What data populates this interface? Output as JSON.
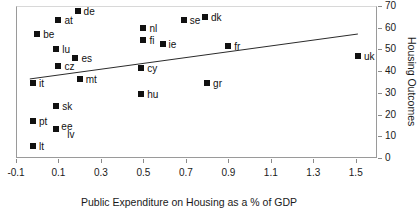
{
  "chart_data": {
    "type": "scatter",
    "title": "",
    "xlabel": "Public Expenditure on Housing as a % of GDP",
    "ylabel": "Housing Outcomes",
    "xlim": [
      -0.1,
      1.6
    ],
    "ylim": [
      0,
      70
    ],
    "xticks": [
      "-0.1",
      "0.1",
      "0.3",
      "0.5",
      "0.7",
      "0.9",
      "1.1",
      "1.3",
      "1.5"
    ],
    "xtick_values": [
      -0.1,
      0.1,
      0.3,
      0.5,
      0.7,
      0.9,
      1.1,
      1.3,
      1.5
    ],
    "yticks": [
      "0",
      "10",
      "20",
      "30",
      "40",
      "50",
      "60",
      "70"
    ],
    "ytick_values": [
      0,
      10,
      20,
      30,
      40,
      50,
      60,
      70
    ],
    "grid": false,
    "legend": "none",
    "y_axis_position": "right",
    "marker_style": "filled-square",
    "marker_color": "#111111",
    "points": [
      {
        "label": "de",
        "x": 0.19,
        "y": 67.7,
        "label_dx": 6,
        "label_dy": -4
      },
      {
        "label": "at",
        "x": 0.1,
        "y": 63.6,
        "label_dx": 6,
        "label_dy": -4
      },
      {
        "label": "be",
        "x": 0.0,
        "y": 57.1,
        "label_dx": 6,
        "label_dy": -4
      },
      {
        "label": "lu",
        "x": 0.09,
        "y": 50.2,
        "label_dx": 6,
        "label_dy": -4
      },
      {
        "label": "es",
        "x": 0.18,
        "y": 46.1,
        "label_dx": 6,
        "label_dy": -4
      },
      {
        "label": "cz",
        "x": 0.1,
        "y": 42.5,
        "label_dx": 6,
        "label_dy": -4
      },
      {
        "label": "it",
        "x": -0.02,
        "y": 34.6,
        "label_dx": 6,
        "label_dy": -4
      },
      {
        "label": "mt",
        "x": 0.2,
        "y": 36.4,
        "label_dx": 6,
        "label_dy": -4
      },
      {
        "label": "sk",
        "x": 0.09,
        "y": 23.9,
        "label_dx": 6,
        "label_dy": -4
      },
      {
        "label": "pt",
        "x": -0.02,
        "y": 17.0,
        "label_dx": 6,
        "label_dy": -4
      },
      {
        "label": "ee",
        "x": 0.09,
        "y": 13.2,
        "label_dx": 5,
        "label_dy": -7
      },
      {
        "label": "lv",
        "x": 0.09,
        "y": 13.2,
        "label_dx": 11,
        "label_dy": 1
      },
      {
        "label": "lt",
        "x": -0.02,
        "y": 5.5,
        "label_dx": 6,
        "label_dy": -4
      },
      {
        "label": "nl",
        "x": 0.5,
        "y": 59.9,
        "label_dx": 6,
        "label_dy": -4
      },
      {
        "label": "fi",
        "x": 0.5,
        "y": 54.4,
        "label_dx": 6,
        "label_dy": -4
      },
      {
        "label": "ie",
        "x": 0.59,
        "y": 52.5,
        "label_dx": 6,
        "label_dy": -4
      },
      {
        "label": "se",
        "x": 0.69,
        "y": 63.6,
        "label_dx": 6,
        "label_dy": -4
      },
      {
        "label": "dk",
        "x": 0.79,
        "y": 65.0,
        "label_dx": 6,
        "label_dy": -4
      },
      {
        "label": "cy",
        "x": 0.49,
        "y": 41.4,
        "label_dx": 6,
        "label_dy": -4
      },
      {
        "label": "hu",
        "x": 0.49,
        "y": 29.4,
        "label_dx": 6,
        "label_dy": -4
      },
      {
        "label": "gr",
        "x": 0.8,
        "y": 34.7,
        "label_dx": 6,
        "label_dy": -4
      },
      {
        "label": "fr",
        "x": 0.9,
        "y": 51.5,
        "label_dx": 6,
        "label_dy": -4
      },
      {
        "label": "uk",
        "x": 1.51,
        "y": 47.0,
        "label_dx": 6,
        "label_dy": -4
      }
    ],
    "trendline": {
      "x0": -0.035,
      "y0": 36.4,
      "x1": 1.51,
      "y1": 57.1,
      "color": "#2b2b2b"
    }
  }
}
